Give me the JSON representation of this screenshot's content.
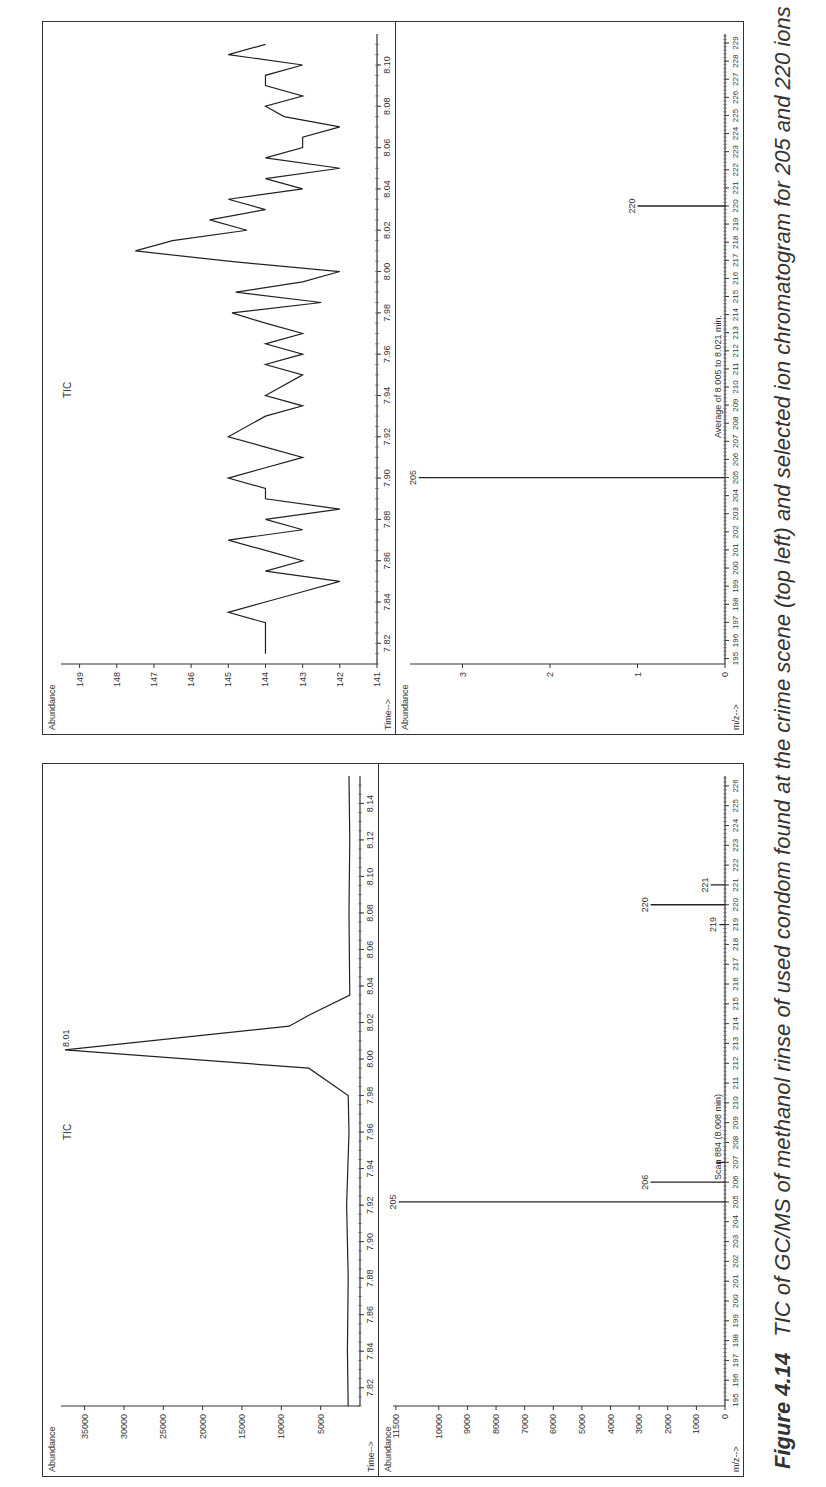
{
  "caption": {
    "figure_label": "Figure 4.14",
    "text": "TIC of GC/MS of methanol rinse of used condom found at the crime scene (top left) and selected ion chromatogram for 205 and 220 ions"
  },
  "chart_data": [
    {
      "type": "line",
      "title": "TIC",
      "panel": "left-top",
      "xlabel": "Time-->",
      "ylabel": "Abundance",
      "x_ticks": [
        "7.82",
        "7.84",
        "7.86",
        "7.88",
        "7.90",
        "7.92",
        "7.94",
        "7.96",
        "7.98",
        "8.00",
        "8.02",
        "8.04",
        "8.06",
        "8.08",
        "8.10",
        "8.12",
        "8.14"
      ],
      "y_ticks": [
        "5000",
        "10000",
        "15000",
        "20000",
        "25000",
        "30000",
        "35000"
      ],
      "xlim": [
        7.81,
        8.155
      ],
      "ylim": [
        0,
        38000
      ],
      "annotations": [
        "8.01"
      ],
      "x": [
        7.81,
        7.84,
        7.88,
        7.92,
        7.96,
        7.98,
        7.995,
        8.005,
        8.018,
        8.024,
        8.035,
        8.08,
        8.12,
        8.155
      ],
      "values": [
        1500,
        1600,
        1500,
        1700,
        1400,
        1500,
        6500,
        37500,
        9000,
        6500,
        1300,
        1400,
        1300,
        1400
      ]
    },
    {
      "type": "bar",
      "title": "Scan 884 (8.008 min)",
      "panel": "left-bottom",
      "xlabel": "m/z-->",
      "ylabel": "Abundance",
      "x_ticks": [
        "195",
        "196",
        "197",
        "198",
        "199",
        "200",
        "201",
        "202",
        "203",
        "204",
        "205",
        "206",
        "207",
        "208",
        "209",
        "210",
        "211",
        "212",
        "213",
        "214",
        "215",
        "216",
        "217",
        "218",
        "219",
        "220",
        "221",
        "222",
        "223",
        "224",
        "225",
        "226"
      ],
      "y_ticks": [
        "0",
        "1000",
        "2000",
        "3000",
        "4000",
        "5000",
        "6000",
        "7000",
        "8000",
        "9000",
        "10000",
        "11500"
      ],
      "ylim": [
        0,
        11600
      ],
      "categories": [
        "205",
        "206",
        "207",
        "219",
        "220",
        "221"
      ],
      "values": [
        11400,
        2600,
        300,
        200,
        2600,
        500
      ],
      "peak_labels": [
        "205",
        "206",
        "219",
        "220",
        "221"
      ]
    },
    {
      "type": "line",
      "title": "TIC",
      "panel": "right-top",
      "xlabel": "Time-->",
      "ylabel": "Abundance",
      "x_ticks": [
        "7.82",
        "7.84",
        "7.86",
        "7.88",
        "7.90",
        "7.92",
        "7.94",
        "7.96",
        "7.98",
        "8.00",
        "8.02",
        "8.04",
        "8.06",
        "8.08",
        "8.10"
      ],
      "y_ticks": [
        "141",
        "142",
        "143",
        "144",
        "145",
        "146",
        "147",
        "148",
        "149"
      ],
      "xlim": [
        7.81,
        8.115
      ],
      "ylim": [
        141,
        149.5
      ],
      "x": [
        7.815,
        7.83,
        7.835,
        7.84,
        7.845,
        7.85,
        7.855,
        7.86,
        7.865,
        7.87,
        7.875,
        7.88,
        7.885,
        7.89,
        7.895,
        7.9,
        7.905,
        7.91,
        7.915,
        7.92,
        7.93,
        7.935,
        7.94,
        7.95,
        7.955,
        7.96,
        7.965,
        7.97,
        7.975,
        7.98,
        7.985,
        7.99,
        7.995,
        8.0,
        8.005,
        8.01,
        8.015,
        8.02,
        8.025,
        8.03,
        8.035,
        8.04,
        8.045,
        8.05,
        8.055,
        8.06,
        8.065,
        8.07,
        8.075,
        8.08,
        8.085,
        8.09,
        8.095,
        8.1,
        8.105,
        8.11
      ],
      "values": [
        144,
        144,
        145,
        144,
        143,
        142,
        144,
        143,
        144,
        145,
        143,
        144,
        142,
        144,
        144,
        145,
        144,
        143,
        144,
        145,
        144,
        143,
        144,
        143,
        144,
        143,
        144,
        143,
        144,
        144.9,
        142.5,
        144.8,
        143,
        142,
        145,
        147.5,
        146.5,
        144.5,
        145.5,
        144,
        145,
        143,
        144,
        142,
        144,
        143,
        143,
        142,
        143.5,
        144,
        143,
        144,
        144,
        143,
        145,
        144
      ]
    },
    {
      "type": "bar",
      "title": "Average of 8.005 to 8.021 min.",
      "panel": "right-bottom",
      "xlabel": "m/z-->",
      "ylabel": "Abundance",
      "x_ticks": [
        "195",
        "196",
        "197",
        "198",
        "199",
        "200",
        "201",
        "202",
        "203",
        "204",
        "205",
        "206",
        "207",
        "208",
        "209",
        "210",
        "211",
        "212",
        "213",
        "214",
        "215",
        "216",
        "217",
        "218",
        "219",
        "220",
        "221",
        "222",
        "223",
        "224",
        "225",
        "226",
        "227",
        "228",
        "229"
      ],
      "y_ticks": [
        "0",
        "1",
        "2",
        "3"
      ],
      "ylim": [
        0,
        3.6
      ],
      "categories": [
        "205",
        "220"
      ],
      "values": [
        3.5,
        1.0
      ],
      "peak_labels": [
        "205",
        "220"
      ]
    }
  ],
  "figures": {
    "left": {
      "top": {
        "title": "TIC",
        "peak_label": "8.01",
        "y_axis_label": "Abundance",
        "x_axis_label": "Time-->"
      },
      "bottom": {
        "title": "Scan 884 (8.008 min)",
        "y_axis_label": "Abundance",
        "x_axis_label": "m/z-->"
      }
    },
    "right": {
      "top": {
        "title": "TIC",
        "y_axis_label": "Abundance",
        "x_axis_label": "Time-->"
      },
      "bottom": {
        "title": "Average of 8.005 to 8.021 min.",
        "y_axis_label": "Abundance",
        "x_axis_label": "m/z-->"
      }
    }
  }
}
